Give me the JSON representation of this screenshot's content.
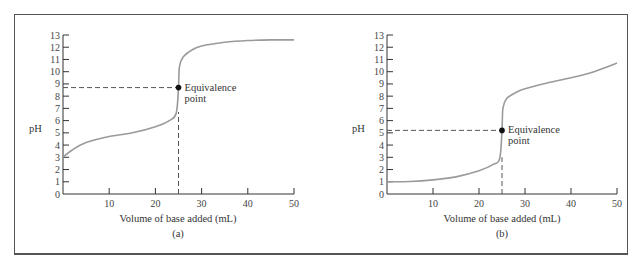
{
  "chart_data": [
    {
      "type": "line",
      "panel": "(a)",
      "xlabel": "Volume of base added (mL)",
      "ylabel": "pH",
      "xlim": [
        0,
        50
      ],
      "ylim": [
        0,
        13
      ],
      "x_ticks": [
        10,
        20,
        30,
        40,
        50
      ],
      "y_ticks": [
        0,
        1,
        2,
        3,
        4,
        5,
        6,
        7,
        8,
        9,
        10,
        11,
        12,
        13
      ],
      "grid": false,
      "series": [
        {
          "name": "titration curve",
          "x": [
            0,
            2,
            5,
            10,
            15,
            20,
            23,
            24.5,
            25,
            25.2,
            26,
            28,
            30,
            35,
            40,
            45,
            50
          ],
          "y": [
            3.0,
            3.6,
            4.2,
            4.7,
            5.0,
            5.5,
            6.0,
            6.6,
            8.7,
            10.4,
            11.2,
            11.8,
            12.1,
            12.4,
            12.55,
            12.6,
            12.6
          ]
        }
      ],
      "annotations": [
        {
          "text": "Equivalence point",
          "x": 25,
          "y": 8.7
        }
      ],
      "reference_lines": [
        {
          "type": "horizontal",
          "y": 8.7,
          "from_x": 0,
          "to_x": 25,
          "style": "dashed"
        },
        {
          "type": "vertical",
          "x": 25,
          "from_y": 0,
          "to_y": 6.7,
          "style": "dashed"
        }
      ]
    },
    {
      "type": "line",
      "panel": "(b)",
      "xlabel": "Volume of base added (mL)",
      "ylabel": "pH",
      "xlim": [
        0,
        50
      ],
      "ylim": [
        0,
        13
      ],
      "x_ticks": [
        10,
        20,
        30,
        40,
        50
      ],
      "y_ticks": [
        0,
        1,
        2,
        3,
        4,
        5,
        6,
        7,
        8,
        9,
        10,
        11,
        12,
        13
      ],
      "grid": false,
      "series": [
        {
          "name": "titration curve",
          "x": [
            0,
            5,
            10,
            15,
            20,
            23,
            24.5,
            25,
            25.2,
            26,
            28,
            30,
            35,
            40,
            45,
            50
          ],
          "y": [
            1.0,
            1.02,
            1.15,
            1.4,
            1.9,
            2.4,
            2.9,
            5.2,
            7.0,
            7.8,
            8.3,
            8.6,
            9.1,
            9.5,
            10.0,
            10.7
          ]
        }
      ],
      "annotations": [
        {
          "text": "Equivalence point",
          "x": 25,
          "y": 5.2
        }
      ],
      "reference_lines": [
        {
          "type": "horizontal",
          "y": 5.2,
          "from_x": 0,
          "to_x": 25,
          "style": "dashed"
        },
        {
          "type": "vertical",
          "x": 25,
          "from_y": 0,
          "to_y": 3.0,
          "style": "dashed"
        }
      ]
    }
  ],
  "charts": {
    "a": {
      "ylabel": "pH",
      "xlabel": "Volume of base added (mL)",
      "caption": "(a)",
      "annotation_line1": "Equivalence",
      "annotation_line2": "point",
      "x_ticks": [
        "10",
        "20",
        "30",
        "40",
        "50"
      ],
      "y_ticks": [
        "0",
        "1",
        "2",
        "3",
        "4",
        "5",
        "6",
        "7",
        "8",
        "9",
        "10",
        "11",
        "12",
        "13"
      ]
    },
    "b": {
      "ylabel": "pH",
      "xlabel": "Volume of base added (mL)",
      "caption": "(b)",
      "annotation_line1": "Equivalence",
      "annotation_line2": "point",
      "x_ticks": [
        "10",
        "20",
        "30",
        "40",
        "50"
      ],
      "y_ticks": [
        "0",
        "1",
        "2",
        "3",
        "4",
        "5",
        "6",
        "7",
        "8",
        "9",
        "10",
        "11",
        "12",
        "13"
      ]
    }
  },
  "colors": {
    "curve": "#9a9a9a",
    "axis": "#333333",
    "dashed": "#555555",
    "point": "#111111"
  }
}
